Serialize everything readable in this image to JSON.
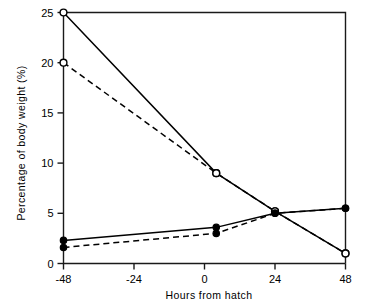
{
  "chart_data": {
    "type": "line",
    "title": "",
    "xlabel": "Hours from hatch",
    "ylabel": "Percentage of body weight (%)",
    "xlim": [
      -48,
      48
    ],
    "ylim": [
      0,
      25
    ],
    "xticks": [
      -48,
      -24,
      0,
      24,
      48
    ],
    "xtick_labels": [
      "-48",
      "-24",
      "0",
      "24",
      "48"
    ],
    "yticks": [
      0,
      5,
      10,
      15,
      20,
      25
    ],
    "ytick_labels": [
      "0",
      "5",
      "10",
      "15",
      "20",
      "25"
    ],
    "grid": false,
    "legend": "none",
    "frame": "top and right border box",
    "series": [
      {
        "name": "yolk-sac solid open-circle",
        "line_style": "solid",
        "marker": "open-circle",
        "x": [
          -48,
          4,
          24,
          48
        ],
        "values": [
          25.0,
          9.0,
          5.2,
          1.0
        ]
      },
      {
        "name": "yolk-sac dashed open-circle",
        "line_style": "dashed",
        "marker": "open-circle",
        "x": [
          -48,
          4,
          24,
          48
        ],
        "values": [
          20.0,
          9.0,
          5.2,
          1.0
        ]
      },
      {
        "name": "body solid filled-circle",
        "line_style": "solid",
        "marker": "filled-circle",
        "x": [
          -48,
          4,
          24,
          48
        ],
        "values": [
          2.3,
          3.6,
          5.0,
          5.5
        ]
      },
      {
        "name": "body dashed filled-circle",
        "line_style": "dashed",
        "marker": "filled-circle",
        "x": [
          -48,
          4,
          24,
          48
        ],
        "values": [
          1.6,
          3.0,
          5.0,
          5.5
        ]
      }
    ]
  }
}
